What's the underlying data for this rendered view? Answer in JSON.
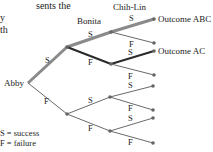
{
  "intro_fragment": [
    "sents the",
    "y",
    "th"
  ],
  "levels": {
    "abby": "Abby",
    "bonita": "Bonita",
    "chihlin": "Chih-Lin"
  },
  "outcomes": {
    "abc": "Outcome ABC",
    "ac": "Outcome AC"
  },
  "labels": {
    "s": "S",
    "f": "F"
  },
  "legend": {
    "s": "S = success",
    "f": "F = failure"
  },
  "colors": {
    "thick": "#8a8a8a",
    "dark": "#2a2a2a",
    "thin": "#6a6a6a"
  }
}
